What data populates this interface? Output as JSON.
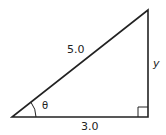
{
  "diagram": {
    "type": "right-triangle",
    "stroke_color": "#222222",
    "hypotenuse_label": "5.0",
    "base_label": "3.0",
    "opposite_label": "y",
    "angle_label": "θ",
    "right_angle_marker": true
  }
}
